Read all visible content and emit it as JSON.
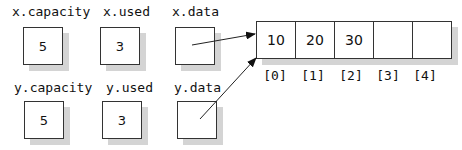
{
  "x": {
    "capacity": {
      "label": "x.capacity",
      "value": "5"
    },
    "used": {
      "label": "x.used",
      "value": "3"
    },
    "data": {
      "label": "x.data",
      "value": ""
    }
  },
  "y": {
    "capacity": {
      "label": "y.capacity",
      "value": "5"
    },
    "used": {
      "label": "y.used",
      "value": "3"
    },
    "data": {
      "label": "y.data",
      "value": ""
    }
  },
  "array": {
    "cells": [
      "10",
      "20",
      "30",
      "",
      ""
    ],
    "indices": [
      "[0]",
      "[1]",
      "[2]",
      "[3]",
      "[4]"
    ]
  }
}
